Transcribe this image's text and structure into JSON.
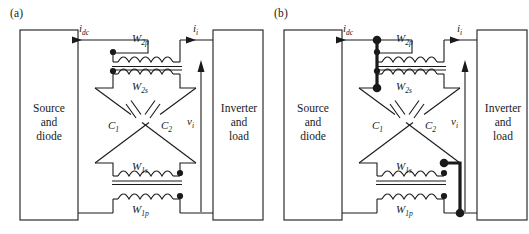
{
  "figure": {
    "type": "circuit-diagram",
    "title": "",
    "width": 529,
    "height": 234,
    "background_color": "#ffffff",
    "line_color": "#1a1a1a"
  },
  "panels": [
    {
      "id": "a",
      "label": "(a)",
      "blocks": [
        {
          "name": "source-block",
          "lines": [
            "Source",
            "and",
            "diode"
          ],
          "side": "left"
        },
        {
          "name": "inverter-block",
          "lines": [
            "Inverter",
            "and",
            "load"
          ],
          "side": "right"
        }
      ],
      "signals": [
        {
          "name": "dc-current",
          "symbol": "i",
          "subscript": "dc",
          "direction": "right"
        },
        {
          "name": "inverter-current",
          "symbol": "i",
          "subscript": "i",
          "direction": "right"
        },
        {
          "name": "inverter-voltage",
          "symbol": "v",
          "subscript": "i",
          "direction": "up"
        }
      ],
      "windings": [
        {
          "name": "w2p",
          "symbol": "W",
          "subscript": "2p",
          "dot_side": "left",
          "position": "top-primary"
        },
        {
          "name": "w2s",
          "symbol": "W",
          "subscript": "2s",
          "dot_side": "left",
          "position": "top-secondary"
        },
        {
          "name": "w1s",
          "symbol": "W",
          "subscript": "1s",
          "dot_side": "right",
          "position": "bottom-secondary"
        },
        {
          "name": "w1p",
          "symbol": "W",
          "subscript": "1p",
          "dot_side": "right",
          "position": "bottom-primary"
        }
      ],
      "capacitors": [
        {
          "name": "c1",
          "symbol": "C",
          "subscript": "1"
        },
        {
          "name": "c2",
          "symbol": "C",
          "subscript": "2"
        }
      ],
      "highlighted_path": false
    },
    {
      "id": "b",
      "label": "(b)",
      "blocks": [
        {
          "name": "source-block",
          "lines": [
            "Source",
            "and",
            "diode"
          ],
          "side": "left"
        },
        {
          "name": "inverter-block",
          "lines": [
            "Inverter",
            "and",
            "load"
          ],
          "side": "right"
        }
      ],
      "signals": [
        {
          "name": "dc-current",
          "symbol": "i",
          "subscript": "dc",
          "direction": "right"
        },
        {
          "name": "inverter-current",
          "symbol": "i",
          "subscript": "i",
          "direction": "right"
        },
        {
          "name": "inverter-voltage",
          "symbol": "v",
          "subscript": "i",
          "direction": "up"
        }
      ],
      "windings": [
        {
          "name": "w2p",
          "symbol": "W",
          "subscript": "2p",
          "dot_side": "left",
          "position": "top-primary"
        },
        {
          "name": "w2s",
          "symbol": "W",
          "subscript": "2s",
          "dot_side": "left",
          "position": "top-secondary"
        },
        {
          "name": "w1s",
          "symbol": "W",
          "subscript": "1s",
          "dot_side": "right",
          "position": "bottom-secondary"
        },
        {
          "name": "w1p",
          "symbol": "W",
          "subscript": "1p",
          "dot_side": "right",
          "position": "bottom-primary"
        }
      ],
      "capacitors": [
        {
          "name": "c1",
          "symbol": "C",
          "subscript": "1"
        },
        {
          "name": "c2",
          "symbol": "C",
          "subscript": "2"
        }
      ],
      "highlighted_path": true
    }
  ],
  "text": {
    "panel_a_label": "(a)",
    "panel_b_label": "(b)",
    "source_line1": "Source",
    "source_line2": "and",
    "source_line3": "diode",
    "inverter_line1": "Inverter",
    "inverter_line2": "and",
    "inverter_line3": "load",
    "i_dc": "i",
    "i_dc_sub": "dc",
    "i_i": "i",
    "i_i_sub": "i",
    "v_i": "v",
    "v_i_sub": "i",
    "w2p": "W",
    "w2p_sub": "2p",
    "w2s": "W",
    "w2s_sub": "2s",
    "w1s": "W",
    "w1s_sub": "1s",
    "w1p": "W",
    "w1p_sub": "1p",
    "c1": "C",
    "c1_sub": "1",
    "c2": "C",
    "c2_sub": "2"
  }
}
